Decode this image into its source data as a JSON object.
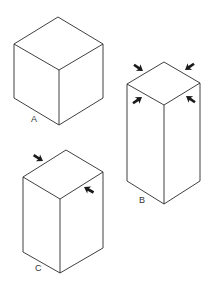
{
  "figure": {
    "labels": {
      "a": "A",
      "b": "B",
      "c": "C"
    },
    "colors": {
      "line": "#2a2a2a",
      "arrow": "#1a1a1a",
      "background": "#ffffff"
    },
    "shapes": [
      {
        "id": "A",
        "type": "cube",
        "arrows": 0
      },
      {
        "id": "B",
        "type": "tall-rectangular-prism",
        "arrows": 4,
        "arrow_targets": "all four top edges pointing inward"
      },
      {
        "id": "C",
        "type": "rectangular-prism",
        "arrows": 2,
        "arrow_targets": "two opposite top edges pointing inward"
      }
    ]
  }
}
